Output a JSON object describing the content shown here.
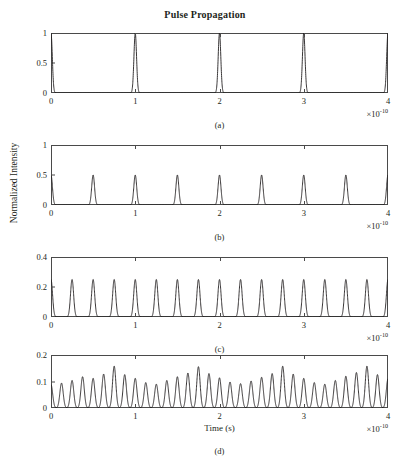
{
  "figure": {
    "title": "Pulse Propagation",
    "ylabel": "Normalized Intensity",
    "xlabel": "Time (s)",
    "exponent_label": "×10",
    "exponent_power": "-10",
    "line_color": "#231f20",
    "frame_color": "#4a4a4a"
  },
  "chart_data": [
    {
      "type": "line",
      "panel": "(a)",
      "title": "Pulse Propagation",
      "xlabel": "",
      "ylabel": "Normalized Intensity",
      "xlim": [
        0,
        4
      ],
      "ylim": [
        0,
        1
      ],
      "xticks": [
        0,
        1,
        2,
        3,
        4
      ],
      "xticklabels": [
        "0",
        "1",
        "2",
        "3",
        "4"
      ],
      "yticks": [
        0,
        0.5,
        1
      ],
      "yticklabels": [
        "0",
        "0.5",
        "1"
      ],
      "x_scale_exponent": -10,
      "grid": false,
      "legend": null,
      "pulse_spacing": 1.0,
      "pulse_width": 0.022,
      "pulse_centers": [
        0,
        1,
        2,
        3,
        4
      ],
      "pulse_peaks": [
        1,
        1,
        1,
        1,
        1
      ]
    },
    {
      "type": "line",
      "panel": "(b)",
      "xlabel": "",
      "ylabel": "Normalized Intensity",
      "xlim": [
        0,
        4
      ],
      "ylim": [
        0,
        1
      ],
      "xticks": [
        0,
        1,
        2,
        3,
        4
      ],
      "xticklabels": [
        "0",
        "1",
        "2",
        "3",
        "4"
      ],
      "yticks": [
        0,
        0.5,
        1
      ],
      "yticklabels": [
        "0",
        "0.5",
        "1"
      ],
      "x_scale_exponent": -10,
      "grid": false,
      "legend": null,
      "pulse_spacing": 0.5,
      "pulse_width": 0.024,
      "pulse_centers": [
        0,
        0.5,
        1,
        1.5,
        2,
        2.5,
        3,
        3.5,
        4
      ],
      "pulse_peaks": [
        0.5,
        0.5,
        0.5,
        0.5,
        0.5,
        0.5,
        0.5,
        0.5,
        0.5
      ]
    },
    {
      "type": "line",
      "panel": "(c)",
      "xlabel": "",
      "ylabel": "Normalized Intensity",
      "xlim": [
        0,
        4
      ],
      "ylim": [
        0,
        0.4
      ],
      "xticks": [
        0,
        1,
        2,
        3,
        4
      ],
      "xticklabels": [
        "0",
        "1",
        "2",
        "3",
        "4"
      ],
      "yticks": [
        0,
        0.2,
        0.4
      ],
      "yticklabels": [
        "0",
        "0.2",
        "0.4"
      ],
      "x_scale_exponent": -10,
      "grid": false,
      "legend": null,
      "pulse_spacing": 0.25,
      "pulse_width": 0.026,
      "pulse_centers": [
        0,
        0.25,
        0.5,
        0.75,
        1,
        1.25,
        1.5,
        1.75,
        2,
        2.25,
        2.5,
        2.75,
        3,
        3.25,
        3.5,
        3.75,
        4
      ],
      "pulse_peaks": [
        0.25,
        0.25,
        0.25,
        0.25,
        0.25,
        0.25,
        0.25,
        0.25,
        0.25,
        0.25,
        0.25,
        0.25,
        0.25,
        0.25,
        0.25,
        0.25,
        0.25
      ]
    },
    {
      "type": "line",
      "panel": "(d)",
      "xlabel": "Time (s)",
      "ylabel": "Normalized Intensity",
      "xlim": [
        0,
        4
      ],
      "ylim": [
        0,
        0.2
      ],
      "xticks": [
        0,
        1,
        2,
        3,
        4
      ],
      "xticklabels": [
        "0",
        "1",
        "2",
        "3",
        "4"
      ],
      "yticks": [
        0,
        0.1,
        0.2
      ],
      "yticklabels": [
        "0",
        "0.1",
        "0.2"
      ],
      "x_scale_exponent": -10,
      "grid": false,
      "legend": null,
      "pulse_spacing": 0.125,
      "pulse_width": 0.028,
      "pulse_centers": [
        0,
        0.125,
        0.25,
        0.375,
        0.5,
        0.625,
        0.75,
        0.875,
        1,
        1.125,
        1.25,
        1.375,
        1.5,
        1.625,
        1.75,
        1.875,
        2,
        2.125,
        2.25,
        2.375,
        2.5,
        2.625,
        2.75,
        2.875,
        3,
        3.125,
        3.25,
        3.375,
        3.5,
        3.625,
        3.75,
        3.875,
        4
      ],
      "pulse_peaks": [
        0.088,
        0.094,
        0.104,
        0.118,
        0.112,
        0.128,
        0.158,
        0.126,
        0.112,
        0.096,
        0.09,
        0.104,
        0.118,
        0.132,
        0.156,
        0.13,
        0.114,
        0.098,
        0.092,
        0.102,
        0.116,
        0.13,
        0.158,
        0.128,
        0.112,
        0.096,
        0.09,
        0.104,
        0.12,
        0.134,
        0.158,
        0.126,
        0.11
      ]
    }
  ],
  "panels": [
    {
      "id": "a",
      "label": "(a)"
    },
    {
      "id": "b",
      "label": "(b)"
    },
    {
      "id": "c",
      "label": "(c)"
    },
    {
      "id": "d",
      "label": "(d)"
    }
  ]
}
